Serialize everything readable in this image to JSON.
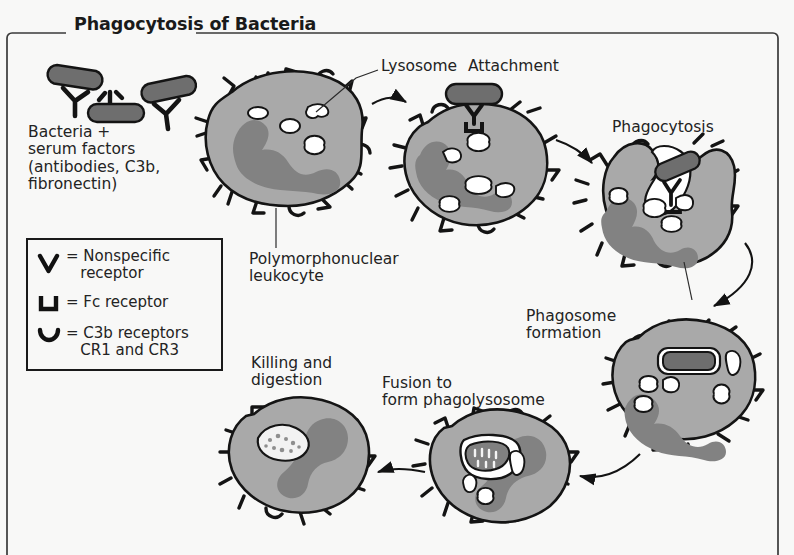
{
  "figure": {
    "title": "Phagocytosis of Bacteria",
    "background_color": "#f8f8f7",
    "frame_color": "#3a3a3a",
    "cytoplasm_color": "#a9a9a9",
    "nucleus_color": "#828282",
    "bacteria_color": "#6e6e6e",
    "vacuole_color": "#ffffff",
    "outline_color": "#1a1a1a"
  },
  "labels": {
    "bacteria_serum": "Bacteria +\nserum factors\n(antibodies, C3b,\nfibronectin)",
    "lysosome": "Lysosome",
    "attachment": "Attachment",
    "phagocytosis": "Phagocytosis",
    "pmn_leukocyte": "Polymorphonuclear\nleukocyte",
    "phagosome_formation": "Phagosome\nformation",
    "fusion": "Fusion to\nform phagolysosome",
    "killing_digestion": "Killing and\ndigestion"
  },
  "legend": {
    "items": [
      {
        "glyph": "nonspecific-receptor-glyph",
        "text": "= Nonspecific\n   receptor"
      },
      {
        "glyph": "fc-receptor-glyph",
        "text": "= Fc receptor"
      },
      {
        "glyph": "c3b-receptor-glyph",
        "text": "= C3b receptors\n   CR1 and CR3"
      }
    ]
  },
  "stages": [
    {
      "name": "bacteria-with-serum-factors",
      "order": 1
    },
    {
      "name": "pmn-leukocyte-resting",
      "order": 2
    },
    {
      "name": "attachment",
      "order": 3
    },
    {
      "name": "phagocytosis",
      "order": 4
    },
    {
      "name": "phagosome-formation",
      "order": 5
    },
    {
      "name": "fusion-to-phagolysosome",
      "order": 6
    },
    {
      "name": "killing-and-digestion",
      "order": 7
    }
  ]
}
